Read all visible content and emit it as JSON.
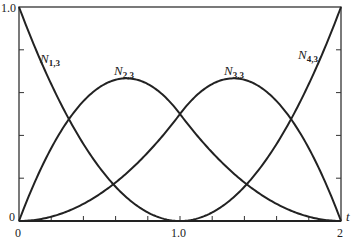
{
  "chart_data": {
    "type": "line",
    "title": "",
    "xlabel": "t",
    "ylabel": "",
    "xlim": [
      0,
      2
    ],
    "ylim": [
      0,
      1
    ],
    "grid": false,
    "x_tick_labels": [
      "0",
      "1.0",
      "2"
    ],
    "y_tick_labels": [
      "0",
      "1.0"
    ],
    "x_minor_tick_step": 0.2,
    "y_minor_tick_step": 0.2,
    "knot_vector": [
      0,
      0,
      0,
      1,
      2,
      2,
      2
    ],
    "x": [
      0,
      0.2,
      0.4,
      0.6,
      0.8,
      1.0,
      1.2,
      1.4,
      1.6,
      1.8,
      2.0
    ],
    "series": [
      {
        "name": "N1,3",
        "label_main": "N",
        "label_sub": "1,3",
        "values": [
          1.0,
          0.64,
          0.36,
          0.16,
          0.04,
          0.0,
          0.0,
          0.0,
          0.0,
          0.0,
          0.0
        ]
      },
      {
        "name": "N2,3",
        "label_main": "N",
        "label_sub": "2,3",
        "values": [
          0.0,
          0.34,
          0.56,
          0.66,
          0.64,
          0.5,
          0.32,
          0.18,
          0.08,
          0.02,
          0.0
        ]
      },
      {
        "name": "N3,3",
        "label_main": "N",
        "label_sub": "3,3",
        "values": [
          0.0,
          0.02,
          0.08,
          0.18,
          0.32,
          0.5,
          0.64,
          0.66,
          0.56,
          0.34,
          0.0
        ]
      },
      {
        "name": "N4,3",
        "label_main": "N",
        "label_sub": "4,3",
        "values": [
          0.0,
          0.0,
          0.0,
          0.0,
          0.0,
          0.0,
          0.04,
          0.16,
          0.36,
          0.64,
          1.0
        ]
      }
    ]
  },
  "axes": {
    "y_top": "1.0",
    "y_bottom": "0",
    "x_left": "0",
    "x_mid": "1.0",
    "x_right": "2",
    "x_var": "t"
  },
  "labels": {
    "n13": {
      "main": "N",
      "sub": "1,3"
    },
    "n23": {
      "main": "N",
      "sub": "2,3"
    },
    "n33": {
      "main": "N",
      "sub": "3,3"
    },
    "n43": {
      "main": "N",
      "sub": "4,3"
    }
  }
}
